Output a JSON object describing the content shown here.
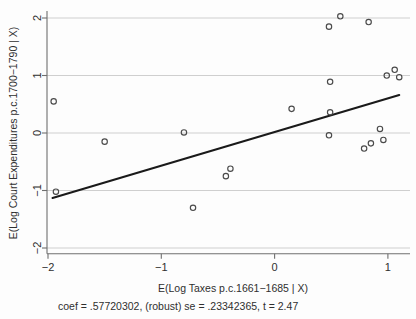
{
  "chart_data": {
    "type": "scatter",
    "title": "",
    "xlabel": "E(Log Taxes p.c.1661−1685 | X)",
    "ylabel": "E(Log Court Expenditures p.c.1700−1790 | X)",
    "xlim": [
      -2.15,
      1.18
    ],
    "ylim": [
      -2.1,
      2.12
    ],
    "xticks": [
      -2,
      -1,
      0,
      1
    ],
    "xticklabels": [
      "−2",
      "−1",
      "0",
      "1"
    ],
    "yticks": [
      -2,
      -1,
      0,
      1,
      2
    ],
    "yticklabels": [
      "−2",
      "−1",
      "0",
      "1",
      "2"
    ],
    "grid": "horizontal",
    "legend": "none",
    "annotation": "coef = .57720302, (robust) se = .23342365, t = 2.47",
    "coef": ".57720302",
    "se": ".23342365",
    "t": "2.47",
    "marker_style": "open-circle",
    "points": [
      {
        "x": -1.95,
        "y": 0.55
      },
      {
        "x": -1.93,
        "y": -1.02
      },
      {
        "x": -1.5,
        "y": -0.15
      },
      {
        "x": -0.8,
        "y": 0.01
      },
      {
        "x": -0.72,
        "y": -1.3
      },
      {
        "x": -0.39,
        "y": -0.62
      },
      {
        "x": -0.43,
        "y": -0.75
      },
      {
        "x": 0.15,
        "y": 0.42
      },
      {
        "x": 0.48,
        "y": 1.85
      },
      {
        "x": 0.58,
        "y": 2.03
      },
      {
        "x": 0.49,
        "y": 0.89
      },
      {
        "x": 0.49,
        "y": 0.36
      },
      {
        "x": 0.48,
        "y": -0.04
      },
      {
        "x": 0.79,
        "y": -0.27
      },
      {
        "x": 0.83,
        "y": 1.93
      },
      {
        "x": 0.85,
        "y": -0.18
      },
      {
        "x": 0.93,
        "y": 0.07
      },
      {
        "x": 0.96,
        "y": -0.12
      },
      {
        "x": 0.99,
        "y": 1.0
      },
      {
        "x": 1.06,
        "y": 1.1
      },
      {
        "x": 1.1,
        "y": 0.97
      }
    ],
    "fit_line": {
      "x0": -1.96,
      "y0": -1.13,
      "x1": 1.1,
      "y1": 0.66,
      "slope": 0.57720302
    },
    "colors": {
      "marker_stroke": "#4a4a4a",
      "fit_line": "#1a1a1a",
      "gridline": "#c9c9c9",
      "axis": "#6f6f6f",
      "text": "#2f2f2f",
      "background": "#fdfdfd"
    }
  }
}
